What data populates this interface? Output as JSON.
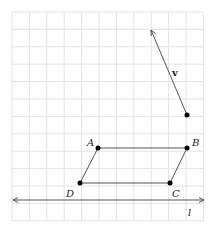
{
  "diagram": {
    "grid": {
      "x0": 12,
      "y0": 12,
      "cols": 11,
      "rows": 12,
      "step": 17.4,
      "color": "#e4e4e4"
    },
    "line_l": {
      "label": "l",
      "y": 200,
      "x1": 12,
      "x2": 205
    },
    "vector_v": {
      "label": "v",
      "tail": [
        187,
        115
      ],
      "head": [
        151,
        30
      ]
    },
    "parallelogram": {
      "A": {
        "label": "A",
        "x": 98,
        "y": 148
      },
      "B": {
        "label": "B",
        "x": 187,
        "y": 148
      },
      "C": {
        "label": "C",
        "x": 170,
        "y": 183
      },
      "D": {
        "label": "D",
        "x": 80,
        "y": 183
      }
    },
    "stroke_color": "#444444",
    "point_color": "#000000"
  }
}
